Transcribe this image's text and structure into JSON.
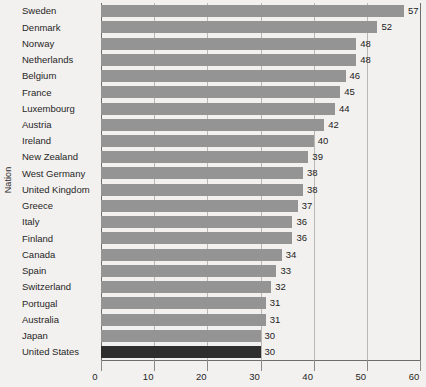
{
  "chart_data": {
    "type": "bar",
    "orientation": "horizontal",
    "title": "",
    "xlabel": "",
    "ylabel": "Nation",
    "xlim": [
      0,
      60
    ],
    "xticks": [
      0,
      10,
      20,
      30,
      40,
      50,
      60
    ],
    "grid": true,
    "legend": "none",
    "bar_color": "#949494",
    "highlight_color": "#2e2e2e",
    "highlight_category": "United States",
    "categories": [
      "Sweden",
      "Denmark",
      "Norway",
      "Netherlands",
      "Belgium",
      "France",
      "Luxembourg",
      "Austria",
      "Ireland",
      "New Zealand",
      "West Germany",
      "United Kingdom",
      "Greece",
      "Italy",
      "Finland",
      "Canada",
      "Spain",
      "Switzerland",
      "Portugal",
      "Australia",
      "Japan",
      "United States"
    ],
    "values": [
      57,
      52,
      48,
      48,
      46,
      45,
      44,
      42,
      40,
      39,
      38,
      38,
      37,
      36,
      36,
      34,
      33,
      32,
      31,
      31,
      30,
      30
    ],
    "data_labels": [
      "57",
      "52",
      "48",
      "48",
      "46",
      "45",
      "44",
      "42",
      "40",
      "39",
      "38",
      "38",
      "37",
      "36",
      "36",
      "34",
      "33",
      "32",
      "31",
      "31",
      "30",
      "30"
    ],
    "xtick_labels": [
      "0",
      "10",
      "20",
      "30",
      "40",
      "50",
      "60"
    ]
  },
  "axes": {
    "y_title": "Nation"
  }
}
